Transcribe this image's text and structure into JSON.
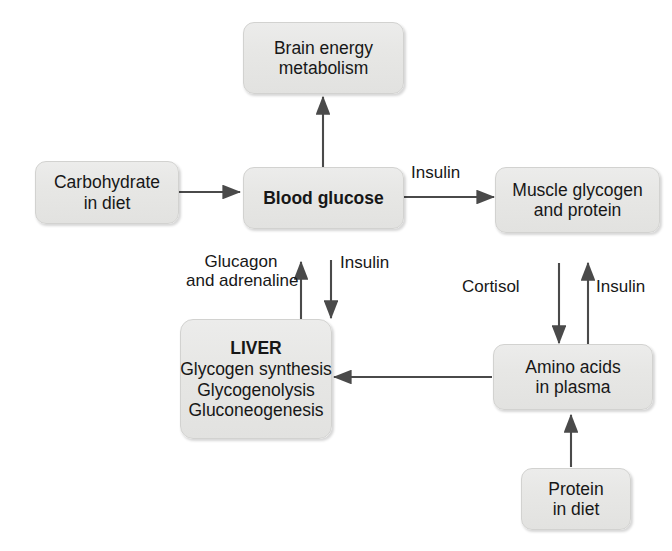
{
  "diagram": {
    "background_color": "#ffffff",
    "node_fill_color": "#e8e8e6",
    "node_border_color": "#d2d2d0",
    "arrow_color": "#4a4a4a",
    "text_color": "#171717",
    "nodes": [
      {
        "id": "brain",
        "name": "brain-energy-metabolism",
        "lines": [
          "Brain energy",
          "metabolism"
        ],
        "bold": false
      },
      {
        "id": "carbohydrate",
        "name": "carbohydrate-in-diet",
        "lines": [
          "Carbohydrate",
          "in diet"
        ],
        "bold": false
      },
      {
        "id": "blood_glucose",
        "name": "blood-glucose",
        "lines": [
          "Blood glucose"
        ],
        "bold": true
      },
      {
        "id": "muscle",
        "name": "muscle-glycogen-and-protein",
        "lines": [
          "Muscle glycogen",
          "and protein"
        ],
        "bold": false
      },
      {
        "id": "liver",
        "name": "liver",
        "title": "LIVER",
        "lines": [
          "Glycogen synthesis",
          "Glycogenolysis",
          "Gluconeogenesis"
        ],
        "bold": false
      },
      {
        "id": "amino_acids",
        "name": "amino-acids-in-plasma",
        "lines": [
          "Amino acids",
          "in plasma"
        ],
        "bold": false
      },
      {
        "id": "protein",
        "name": "protein-in-diet",
        "lines": [
          "Protein",
          "in diet"
        ],
        "bold": false
      }
    ],
    "edges": [
      {
        "id": "e_glucose_brain",
        "from": "blood_glucose",
        "to": "brain",
        "label": ""
      },
      {
        "id": "e_carb_glucose",
        "from": "carbohydrate",
        "to": "blood_glucose",
        "label": ""
      },
      {
        "id": "e_glucose_muscle",
        "from": "blood_glucose",
        "to": "muscle",
        "label": "Insulin"
      },
      {
        "id": "e_liver_glucose",
        "from": "liver",
        "to": "blood_glucose",
        "label": "Glucagon and adrenaline"
      },
      {
        "id": "e_glucose_liver",
        "from": "blood_glucose",
        "to": "liver",
        "label": "Insulin"
      },
      {
        "id": "e_muscle_amino",
        "from": "muscle",
        "to": "amino_acids",
        "label": "Cortisol"
      },
      {
        "id": "e_amino_muscle",
        "from": "amino_acids",
        "to": "muscle",
        "label": "Insulin"
      },
      {
        "id": "e_amino_liver",
        "from": "amino_acids",
        "to": "liver",
        "label": ""
      },
      {
        "id": "e_protein_amino",
        "from": "protein",
        "to": "amino_acids",
        "label": ""
      }
    ],
    "labels": {
      "insulin_to_muscle": "Insulin",
      "glucagon_line1": "Glucagon",
      "glucagon_line2": "and adrenaline",
      "insulin_to_liver": "Insulin",
      "cortisol": "Cortisol",
      "insulin_to_muscle_from_amino": "Insulin"
    }
  }
}
